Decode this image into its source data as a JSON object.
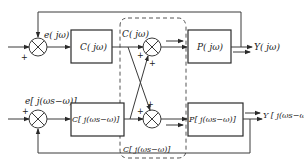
{
  "diagram": {
    "type": "block-diagram",
    "upper_loop": {
      "error_label": "e( jω)",
      "controller_label": "C( jω)",
      "controller_output_label": "C( jω)",
      "plant_label": "P( jω)",
      "output_label": "Y( jω)"
    },
    "lower_loop": {
      "error_label": "e[ j(ωs−ω)]",
      "controller_label": "C[ j(ωs−ω)]",
      "controller_output_label": "C[ j(ωs−ω)]",
      "plant_label": "P[ j(ωs−ω)]",
      "output_label": "Y [ j(ωs−ω)]"
    },
    "signs": {
      "plus": "+"
    },
    "coupling_region": "dashed cross-coupling block"
  }
}
